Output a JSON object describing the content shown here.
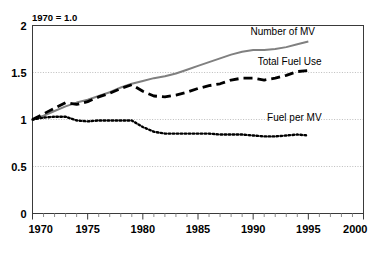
{
  "chart_data": {
    "type": "line",
    "title": "",
    "note": "1970 = 1.0",
    "xlabel": "",
    "ylabel": "",
    "xlim": [
      1970,
      2000
    ],
    "ylim": [
      0,
      2
    ],
    "grid": true,
    "legend_position": "inline-right",
    "x_ticks": [
      1970,
      1975,
      1980,
      1985,
      1990,
      1995,
      2000
    ],
    "x_tick_labels": [
      "1970",
      "1975",
      "1980",
      "1985",
      "1990",
      "1995",
      "2000"
    ],
    "x_minor_tick_step": 1,
    "y_ticks": [
      0,
      0.5,
      1,
      1.5,
      2
    ],
    "y_tick_labels": [
      "0",
      "0.5",
      "1",
      "1.5",
      "2"
    ],
    "x": [
      1970,
      1971,
      1972,
      1973,
      1974,
      1975,
      1976,
      1977,
      1978,
      1979,
      1980,
      1981,
      1982,
      1983,
      1984,
      1985,
      1986,
      1987,
      1988,
      1989,
      1990,
      1991,
      1992,
      1993,
      1994,
      1995
    ],
    "series": [
      {
        "name": "Number of MV",
        "color": "#808080",
        "style": "solid",
        "values": [
          1.0,
          1.04,
          1.09,
          1.14,
          1.18,
          1.21,
          1.25,
          1.29,
          1.34,
          1.38,
          1.41,
          1.44,
          1.46,
          1.49,
          1.53,
          1.57,
          1.61,
          1.65,
          1.69,
          1.72,
          1.74,
          1.74,
          1.75,
          1.77,
          1.8,
          1.83
        ]
      },
      {
        "name": "Total Fuel Use",
        "color": "#000000",
        "style": "dashed",
        "values": [
          1.0,
          1.06,
          1.12,
          1.18,
          1.16,
          1.19,
          1.24,
          1.28,
          1.33,
          1.37,
          1.3,
          1.25,
          1.24,
          1.26,
          1.29,
          1.33,
          1.36,
          1.38,
          1.42,
          1.44,
          1.44,
          1.42,
          1.44,
          1.47,
          1.51,
          1.52
        ]
      },
      {
        "name": "Fuel per MV",
        "color": "#000000",
        "style": "dotted",
        "values": [
          1.0,
          1.02,
          1.03,
          1.03,
          0.99,
          0.98,
          0.99,
          0.99,
          0.99,
          0.99,
          0.92,
          0.87,
          0.85,
          0.85,
          0.85,
          0.85,
          0.85,
          0.84,
          0.84,
          0.84,
          0.83,
          0.82,
          0.82,
          0.83,
          0.84,
          0.83
        ]
      }
    ],
    "annotations": [
      {
        "text": "Number of MV",
        "x": 1995.6,
        "y": 1.9,
        "anchor": "end"
      },
      {
        "text": "Total Fuel Use",
        "x": 1996.2,
        "y": 1.58,
        "anchor": "end"
      },
      {
        "text": "Fuel per MV",
        "x": 1996.2,
        "y": 0.98,
        "anchor": "end"
      }
    ]
  }
}
